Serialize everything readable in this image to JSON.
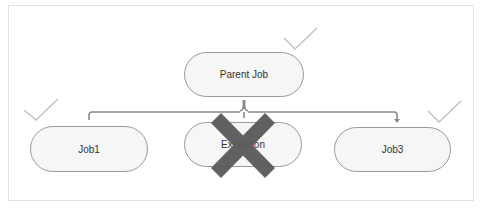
{
  "diagram": {
    "type": "job-hierarchy",
    "parent": {
      "label": "Parent Job",
      "status": "success",
      "status_icon": "checkmark-icon"
    },
    "children": [
      {
        "label": "Job1",
        "status": "success",
        "status_icon": "checkmark-icon"
      },
      {
        "label": "Exception",
        "status": "failed",
        "status_icon": "x-mark-icon"
      },
      {
        "label": "Job3",
        "status": "success",
        "status_icon": "checkmark-icon"
      }
    ],
    "colors": {
      "frame_border": "#e2e2e2",
      "node_fill": "#f6f6f6",
      "node_border": "#9a9a9a",
      "connector": "#8a8a8a",
      "checkmark": "#c4c4c4",
      "x_mark": "#5a5a5a"
    }
  }
}
